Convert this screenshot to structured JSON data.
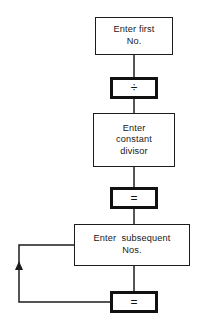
{
  "diagram": {
    "background_color": "#ffffff",
    "line_color": "#1c1c1c",
    "nodes": [
      {
        "id": "enter-first",
        "kind": "process",
        "border": "thin",
        "lines": [
          "Enter first",
          "No."
        ]
      },
      {
        "id": "op-divide",
        "kind": "key",
        "border": "thick",
        "lines": [
          "÷"
        ]
      },
      {
        "id": "enter-divisor",
        "kind": "process",
        "border": "thin",
        "lines": [
          "Enter",
          "constant",
          "divisor"
        ]
      },
      {
        "id": "op-equals-1",
        "kind": "key",
        "border": "thick",
        "lines": [
          "="
        ]
      },
      {
        "id": "enter-subsequent",
        "kind": "process",
        "border": "thin",
        "lines": [
          "Enter  subsequent",
          "Nos."
        ]
      },
      {
        "id": "op-equals-2",
        "kind": "key",
        "border": "thick",
        "lines": [
          "="
        ]
      }
    ],
    "node_text": {
      "enter_first_line1": "Enter first",
      "enter_first_line2": "No.",
      "op_divide": "÷",
      "enter_divisor_line1": "Enter",
      "enter_divisor_line2": "constant",
      "enter_divisor_line3": "divisor",
      "op_equals_1": "=",
      "enter_subsequent_line1": "Enter  subsequent",
      "enter_subsequent_line2": "Nos.",
      "op_equals_2": "="
    },
    "connectors": [
      {
        "id": "c1",
        "from": "enter-first",
        "to": "op-divide",
        "arrow": false
      },
      {
        "id": "c2",
        "from": "op-divide",
        "to": "enter-divisor",
        "arrow": false
      },
      {
        "id": "c3",
        "from": "enter-divisor",
        "to": "op-equals-1",
        "arrow": false
      },
      {
        "id": "c4",
        "from": "op-equals-1",
        "to": "enter-subsequent",
        "arrow": false
      },
      {
        "id": "c5",
        "from": "enter-subsequent",
        "to": "op-equals-2",
        "arrow": false
      },
      {
        "id": "loop",
        "from": "op-equals-2",
        "to": "enter-subsequent",
        "arrow": true,
        "direction": "up"
      }
    ]
  }
}
